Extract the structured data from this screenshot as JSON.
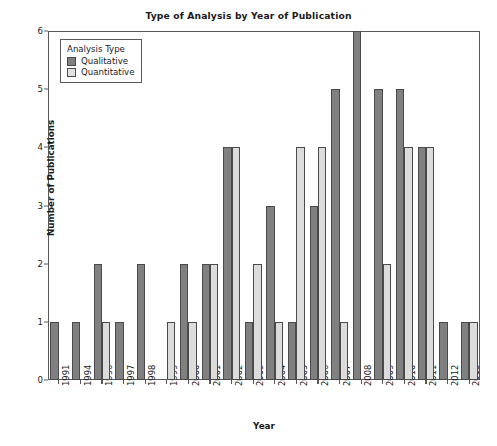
{
  "chart_data": {
    "type": "bar",
    "title": "Type of Analysis by Year of Publication",
    "xlabel": "Year",
    "ylabel": "Number of Publications",
    "ylim": [
      0,
      6
    ],
    "yticks": [
      0,
      1,
      2,
      3,
      4,
      5,
      6
    ],
    "grid": false,
    "legend_position": "upper-left",
    "legend_title": "Analysis Type",
    "categories": [
      "1991",
      "1994",
      "1996",
      "1997",
      "1998",
      "1999",
      "2000",
      "2001",
      "2002",
      "2003",
      "2004",
      "2005",
      "2006",
      "2007",
      "2008",
      "2009",
      "2010",
      "2011",
      "2012",
      "2013"
    ],
    "series": [
      {
        "name": "Qualitative",
        "color": "#808080",
        "values": [
          1,
          1,
          2,
          1,
          2,
          0,
          2,
          2,
          4,
          1,
          3,
          1,
          3,
          5,
          6,
          5,
          5,
          4,
          1,
          1
        ]
      },
      {
        "name": "Quantitative",
        "color": "#dcdcdc",
        "values": [
          0,
          0,
          1,
          0,
          0,
          1,
          1,
          2,
          4,
          2,
          1,
          4,
          4,
          1,
          0,
          2,
          4,
          4,
          0,
          1
        ]
      }
    ]
  },
  "legend": {
    "title": "Analysis Type",
    "entries": [
      {
        "label": "Qualitative",
        "swatch": "qualitative"
      },
      {
        "label": "Quantitative",
        "swatch": "quantitative"
      }
    ]
  },
  "caption": {
    "text": ""
  }
}
